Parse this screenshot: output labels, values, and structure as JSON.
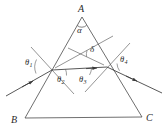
{
  "figure": {
    "type": "optics-ray-diagram",
    "stroke_color": "#3a3a3a",
    "label_color": "#2b2b2b",
    "background_color": "#ffffff",
    "width": 165,
    "height": 139
  },
  "vertices": [
    {
      "name": "A",
      "label": "A",
      "x": 82,
      "y": 12,
      "role": "apex"
    },
    {
      "name": "B",
      "label": "B",
      "x": 16,
      "y": 122,
      "role": "base-left"
    },
    {
      "name": "C",
      "label": "C",
      "x": 148,
      "y": 120,
      "role": "base-right"
    }
  ],
  "angles": [
    {
      "name": "alpha",
      "label": "α",
      "at": "apex-A",
      "x": 79,
      "y": 25,
      "meaning": "prism apex angle"
    },
    {
      "name": "delta",
      "label": "δ",
      "at": "ray-intersection",
      "x": 90,
      "y": 47,
      "meaning": "angle of deviation"
    },
    {
      "name": "theta1",
      "label": "θ",
      "sub": "1",
      "x": 25,
      "y": 61,
      "meaning": "angle of incidence at entry face"
    },
    {
      "name": "theta2",
      "label": "θ",
      "sub": "2",
      "x": 57,
      "y": 77,
      "meaning": "angle of refraction inside prism at entry face"
    },
    {
      "name": "theta3",
      "label": "θ",
      "sub": "3",
      "x": 79,
      "y": 77,
      "meaning": "angle of incidence inside prism at exit face"
    },
    {
      "name": "theta4",
      "label": "θ",
      "sub": "4",
      "x": 120,
      "y": 57,
      "meaning": "angle of emergence at exit face"
    }
  ],
  "geometry": {
    "triangle": {
      "apex": {
        "x": 82,
        "y": 17
      },
      "base_left": {
        "x": 25,
        "y": 118
      },
      "base_right": {
        "x": 142,
        "y": 117
      }
    },
    "entry_point": {
      "x": 52,
      "y": 70
    },
    "exit_point": {
      "x": 107,
      "y": 67
    },
    "incident_ray": {
      "from_x": 6,
      "from_y": 96,
      "to_x": 52,
      "to_y": 70
    },
    "internal_ray": {
      "from_x": 52,
      "from_y": 70,
      "to_x": 107,
      "to_y": 67
    },
    "emergent_ray": {
      "from_x": 107,
      "from_y": 67,
      "to_x": 162,
      "to_y": 93
    },
    "incident_extension": {
      "from_x": 52,
      "from_y": 70,
      "to_x": 113,
      "to_y": 36
    },
    "emergent_extension": {
      "from_x": 107,
      "from_y": 67,
      "to_x": 68,
      "to_y": 48
    },
    "entry_normal": {
      "from_x": 31,
      "from_y": 47,
      "to_x": 74,
      "to_y": 94
    },
    "exit_normal": {
      "from_x": 130,
      "from_y": 43,
      "to_x": 85,
      "to_y": 92
    }
  }
}
